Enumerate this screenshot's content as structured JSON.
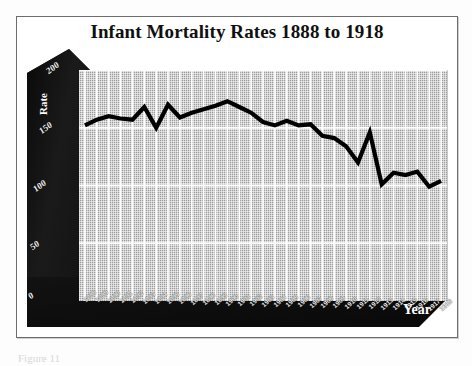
{
  "figure": {
    "title": "Infant Mortality Rates 1888 to 1918",
    "caption": "Figure 11",
    "frame_color": "#6d6d6d",
    "panel_color": "#9d9d9d",
    "wall_color": "#121212",
    "line_color": "#000000",
    "grid_color": "#ffffff"
  },
  "chart_data": {
    "type": "line",
    "title": "Infant Mortality Rates 1888 to 1918",
    "xlabel": "Year",
    "ylabel": "Rate",
    "ylim": [
      0,
      200
    ],
    "yticks": [
      0,
      50,
      100,
      150,
      200
    ],
    "ytick_labels": [
      "0",
      "50",
      "100",
      "150",
      "200"
    ],
    "grid": true,
    "legend": "none",
    "style": "3d-perspective",
    "x": [
      1888,
      1889,
      1890,
      1891,
      1892,
      1893,
      1894,
      1895,
      1896,
      1897,
      1898,
      1899,
      1900,
      1901,
      1902,
      1903,
      1904,
      1905,
      1906,
      1907,
      1908,
      1909,
      1910,
      1911,
      1912,
      1913,
      1914,
      1915,
      1916,
      1917,
      1918
    ],
    "categories": [
      "1888",
      "1889",
      "1890",
      "1891",
      "1892",
      "1893",
      "1894",
      "1895",
      "1896",
      "1897",
      "1898",
      "1899",
      "1900",
      "1901",
      "1902",
      "1903",
      "1904",
      "1905",
      "1906",
      "1907",
      "1908",
      "1909",
      "1910",
      "1911",
      "1912",
      "1913",
      "1914",
      "1915",
      "1916",
      "1917",
      "1918"
    ],
    "series": [
      {
        "name": "Infant Mortality Rate",
        "values": [
          152,
          157,
          160,
          158,
          157,
          168,
          150,
          170,
          159,
          163,
          166,
          169,
          173,
          168,
          163,
          155,
          152,
          156,
          152,
          153,
          143,
          141,
          134,
          120,
          146,
          101,
          111,
          109,
          112,
          99,
          104
        ]
      }
    ]
  },
  "axes": {
    "y_label": "Rate",
    "y_ticks": [
      "200",
      "150",
      "100",
      "50",
      "0"
    ],
    "x_label": "Year",
    "x_ticks": [
      "1888",
      "1889",
      "1890",
      "1891",
      "1892",
      "1893",
      "1894",
      "1895",
      "1896",
      "1897",
      "1898",
      "1899",
      "1900",
      "1901",
      "1902",
      "1903",
      "1904",
      "1905",
      "1906",
      "1907",
      "1908",
      "1909",
      "1910",
      "1911",
      "1912",
      "1913",
      "1914",
      "1915",
      "1916",
      "1917",
      "1918"
    ]
  }
}
